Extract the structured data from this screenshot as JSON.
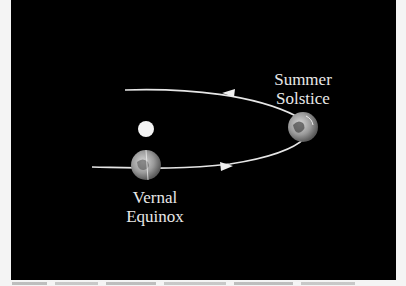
{
  "diagram": {
    "type": "orbit",
    "background": "#000000",
    "labels": {
      "summer": [
        "Summer",
        "Solstice"
      ],
      "vernal": [
        "Vernal",
        "Equinox"
      ]
    },
    "bodies": [
      {
        "name": "sun",
        "cx": 146,
        "cy": 129,
        "r": 8,
        "color": "#f2f2f2"
      },
      {
        "name": "earth-summer-solstice",
        "cx": 303,
        "cy": 127,
        "r": 15
      },
      {
        "name": "earth-vernal-equinox",
        "cx": 146,
        "cy": 165,
        "r": 15
      }
    ],
    "orbit_arrows": [
      {
        "segment": "top",
        "direction": "left"
      },
      {
        "segment": "bottom",
        "direction": "right"
      }
    ]
  },
  "caption": {
    "visible": "partially cut off"
  }
}
